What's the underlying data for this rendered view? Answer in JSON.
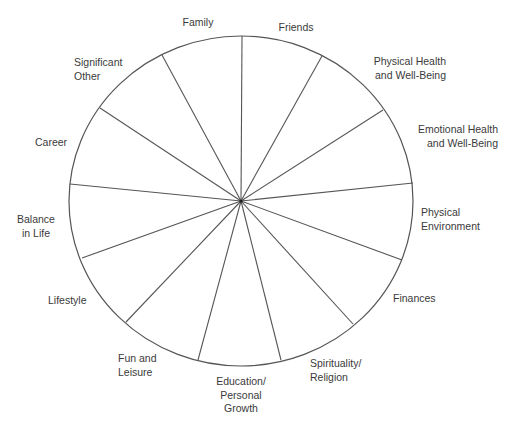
{
  "wheel": {
    "title": "Wheel of Life",
    "center": {
      "x": 241,
      "y": 201
    },
    "radius_x": 172,
    "radius_y": 165,
    "stroke_color": "#555555",
    "background": "#ffffff",
    "spoke_endpoints": [
      [
        242,
        36
      ],
      [
        322,
        56
      ],
      [
        383,
        110
      ],
      [
        413,
        183
      ],
      [
        402,
        260
      ],
      [
        353,
        324
      ],
      [
        281,
        360
      ],
      [
        198,
        360
      ],
      [
        126,
        322
      ],
      [
        82,
        258
      ],
      [
        70,
        184
      ],
      [
        100,
        108
      ],
      [
        162,
        55
      ]
    ]
  },
  "segments": [
    {
      "id": "friends",
      "lines": [
        "Friends"
      ]
    },
    {
      "id": "physical-health",
      "lines": [
        "Physical Health",
        "and Well-Being"
      ]
    },
    {
      "id": "emotional-health",
      "lines": [
        "Emotional Health",
        "and Well-Being"
      ]
    },
    {
      "id": "physical-environment",
      "lines": [
        "Physical",
        "Environment"
      ]
    },
    {
      "id": "finances",
      "lines": [
        "Finances"
      ]
    },
    {
      "id": "spirituality",
      "lines": [
        "Spirituality/",
        "Religion"
      ]
    },
    {
      "id": "education",
      "lines": [
        "Education/",
        "Personal",
        "Growth"
      ]
    },
    {
      "id": "fun-leisure",
      "lines": [
        "Fun and",
        "Leisure"
      ]
    },
    {
      "id": "lifestyle",
      "lines": [
        "Lifestyle"
      ]
    },
    {
      "id": "balance",
      "lines": [
        "Balance",
        "in Life"
      ]
    },
    {
      "id": "career",
      "lines": [
        "Career"
      ]
    },
    {
      "id": "significant-other",
      "lines": [
        "Significant",
        "Other"
      ]
    },
    {
      "id": "family",
      "lines": [
        "Family"
      ]
    }
  ]
}
